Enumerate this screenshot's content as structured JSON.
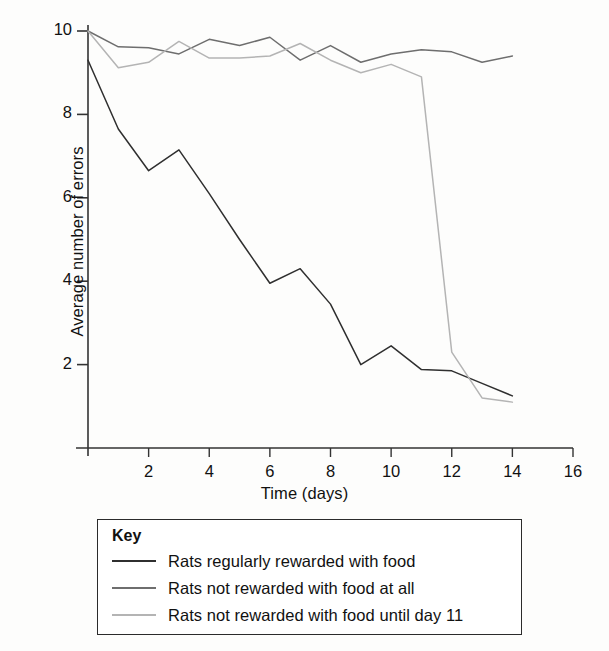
{
  "figure": {
    "background_color": "#fdfdfc"
  },
  "axes": {
    "y_title": "Average number of errors",
    "x_title": "Time (days)",
    "y_ticks": [
      "2",
      "4",
      "6",
      "8",
      "10"
    ],
    "x_ticks": [
      "2",
      "4",
      "6",
      "8",
      "10",
      "12",
      "14",
      "16"
    ]
  },
  "legend": {
    "title": "Key",
    "entries": [
      {
        "label": "Rats regularly rewarded with food",
        "color": "#2f2f2f"
      },
      {
        "label": "Rats not rewarded with food at all",
        "color": "#6e6e6e"
      },
      {
        "label": "Rats not rewarded with food until day 11",
        "color": "#b4b4b4"
      }
    ]
  },
  "chart_data": {
    "type": "line",
    "title": "",
    "xlabel": "Time (days)",
    "ylabel": "Average number of errors",
    "xlim": [
      0,
      16
    ],
    "ylim": [
      0,
      10
    ],
    "xticks": [
      0,
      2,
      4,
      6,
      8,
      10,
      12,
      14,
      16
    ],
    "yticks": [
      0,
      2,
      4,
      6,
      8,
      10
    ],
    "grid": false,
    "legend_position": "below-plot",
    "x": [
      0,
      1,
      2,
      3,
      4,
      5,
      6,
      7,
      8,
      9,
      10,
      11,
      12,
      13,
      14
    ],
    "series": [
      {
        "name": "Rats regularly rewarded with food",
        "color": "#2f2f2f",
        "values": [
          9.3,
          7.65,
          6.65,
          7.15,
          6.1,
          5.0,
          3.95,
          4.3,
          3.45,
          2.0,
          2.45,
          1.88,
          1.85,
          1.55,
          1.25
        ]
      },
      {
        "name": "Rats not rewarded with food at all",
        "color": "#6e6e6e",
        "values": [
          10.0,
          9.62,
          9.6,
          9.45,
          9.8,
          9.65,
          9.85,
          9.3,
          9.65,
          9.25,
          9.45,
          9.55,
          9.5,
          9.25,
          9.4
        ]
      },
      {
        "name": "Rats not rewarded with food until day 11",
        "color": "#b4b4b4",
        "values": [
          10.0,
          9.12,
          9.25,
          9.75,
          9.35,
          9.35,
          9.4,
          9.7,
          9.3,
          9.0,
          9.2,
          8.9,
          2.3,
          1.2,
          1.1
        ]
      }
    ]
  }
}
